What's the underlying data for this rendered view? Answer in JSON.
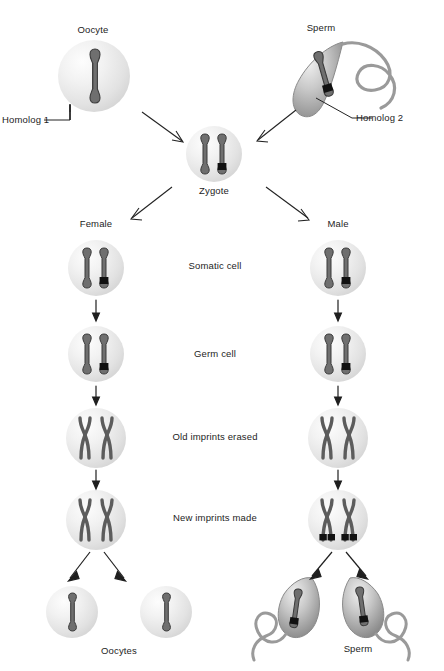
{
  "diagram": {
    "background": "#ffffff",
    "ink": "#4a4a4a",
    "imprint_color": "#141414",
    "labels": {
      "oocyte": "Oocyte",
      "sperm": "Sperm",
      "homolog1": "Homolog 1",
      "homolog2": "Homolog 2",
      "zygote": "Zygote",
      "female": "Female",
      "male": "Male",
      "oocytes": "Oocytes",
      "sperm_plural": "Sperm"
    },
    "stage_labels": [
      {
        "id": "somatic",
        "text": "Somatic cell"
      },
      {
        "id": "germ",
        "text": "Germ cell"
      },
      {
        "id": "erased",
        "text": "Old imprints erased"
      },
      {
        "id": "new",
        "text": "New imprints made"
      }
    ],
    "parental_gametes": [
      {
        "id": "oocyte",
        "type": "oocyte",
        "label": "Oocyte",
        "callout": "Homolog 1",
        "chromosomes": 1,
        "imprinted": false
      },
      {
        "id": "sperm",
        "type": "sperm",
        "label": "Sperm",
        "callout": "Homolog 2",
        "chromosomes": 1,
        "imprinted": true
      }
    ],
    "zygote": {
      "label": "Zygote",
      "chromosomes": 2,
      "imprinted_chromosomes": [
        false,
        true
      ]
    },
    "lineages": [
      {
        "id": "female",
        "label": "Female",
        "stages": [
          {
            "stage": "somatic",
            "form": "single",
            "chromosomes": 2,
            "imprints": [
              false,
              true
            ]
          },
          {
            "stage": "germ",
            "form": "single",
            "chromosomes": 2,
            "imprints": [
              false,
              true
            ]
          },
          {
            "stage": "erased",
            "form": "duplicated",
            "chromosomes": 2,
            "imprints": [
              false,
              false
            ]
          },
          {
            "stage": "new",
            "form": "duplicated",
            "chromosomes": 2,
            "imprints": [
              false,
              false
            ]
          }
        ],
        "gametes": {
          "label": "Oocytes",
          "count": 2,
          "type": "oocyte",
          "imprinted": false
        }
      },
      {
        "id": "male",
        "label": "Male",
        "stages": [
          {
            "stage": "somatic",
            "form": "single",
            "chromosomes": 2,
            "imprints": [
              false,
              true
            ]
          },
          {
            "stage": "germ",
            "form": "single",
            "chromosomes": 2,
            "imprints": [
              false,
              true
            ]
          },
          {
            "stage": "erased",
            "form": "duplicated",
            "chromosomes": 2,
            "imprints": [
              false,
              false
            ]
          },
          {
            "stage": "new",
            "form": "duplicated",
            "chromosomes": 2,
            "imprints": [
              true,
              true
            ]
          }
        ],
        "gametes": {
          "label": "Sperm",
          "count": 2,
          "type": "sperm",
          "imprinted": true
        }
      }
    ]
  }
}
